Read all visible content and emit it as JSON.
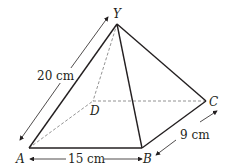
{
  "diagram": {
    "type": "square-based pyramid",
    "vertices": {
      "apex": "Y",
      "base": [
        "A",
        "B",
        "C",
        "D"
      ]
    },
    "labels": {
      "Y": "Y",
      "A": "A",
      "B": "B",
      "C": "C",
      "D": "D"
    },
    "measurements": {
      "slant_edge_AY": "20 cm",
      "base_AB": "15 cm",
      "base_BC": "9 cm"
    },
    "colors": {
      "stroke": "#231f20",
      "hidden_edge": "#777777",
      "background": "#ffffff"
    }
  }
}
